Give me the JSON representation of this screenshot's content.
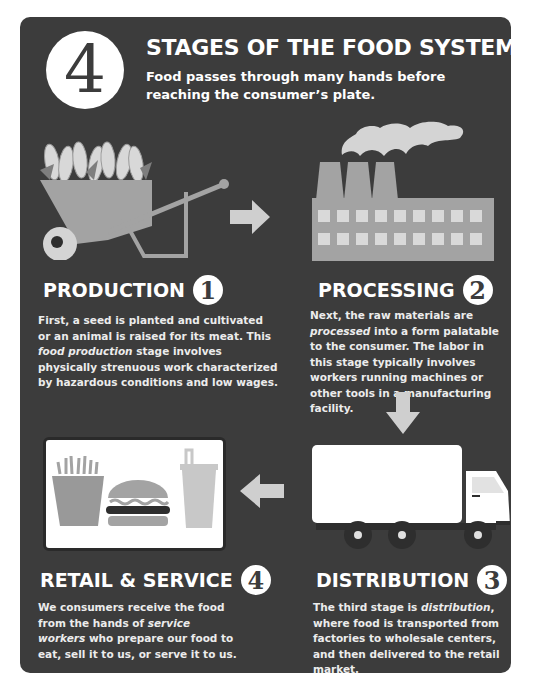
{
  "header": {
    "number": "4",
    "title": "STAGES OF THE FOOD SYSTEM",
    "subtitle": "Food passes through many hands before reaching the consumer’s plate."
  },
  "stages": [
    {
      "number": "1",
      "title": "PRODUCTION",
      "icon": "wheelbarrow-with-corn-icon",
      "text_parts": [
        "First, a seed is planted and cultivated or an animal is raised for its meat. This ",
        "food production",
        " stage involves physically strenuous work characterized by hazardous conditions and low wages."
      ]
    },
    {
      "number": "2",
      "title": "PROCESSING",
      "icon": "factory-icon",
      "text_parts": [
        "Next, the raw materials are ",
        "processed",
        " into a form palatable to the consumer. The labor in this stage typically involves workers running machines or other tools in a manufacturing facility."
      ]
    },
    {
      "number": "3",
      "title": "DISTRIBUTION",
      "icon": "delivery-truck-icon",
      "text_parts": [
        "The third stage is ",
        "distribution",
        ", where food is transported from factories to wholesale centers, and then delivered to the retail market."
      ]
    },
    {
      "number": "4",
      "title": "RETAIL & SERVICE",
      "icon": "fast-food-meal-icon",
      "text_parts": [
        "We consumers receive the food from the hands of ",
        "service workers",
        " who prepare our food to eat, sell it to us, or serve it to us."
      ]
    }
  ],
  "arrows": [
    "right",
    "down",
    "left"
  ],
  "colors": {
    "background": "#3c3c3c",
    "icon_gray": "#a3a3a3",
    "light_gray": "#d4d4d4",
    "text": "#ffffff"
  }
}
